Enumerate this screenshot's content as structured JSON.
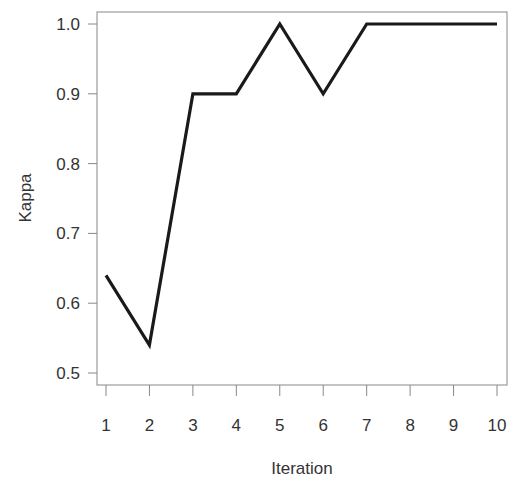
{
  "chart_data": {
    "type": "line",
    "title": "",
    "xlabel": "Iteration",
    "ylabel": "Kappa",
    "x": [
      1,
      2,
      3,
      4,
      5,
      6,
      7,
      8,
      9,
      10
    ],
    "series": [
      {
        "name": "Kappa",
        "values": [
          0.64,
          0.54,
          0.9,
          0.9,
          1.0,
          0.9,
          1.0,
          1.0,
          1.0,
          1.0
        ],
        "color": "#1a1a1a"
      }
    ],
    "xticks": [
      "1",
      "2",
      "3",
      "4",
      "5",
      "6",
      "7",
      "8",
      "9",
      "10"
    ],
    "yticks": [
      "0.5",
      "0.6",
      "0.7",
      "0.8",
      "0.9",
      "1.0"
    ],
    "xlim": [
      0.8,
      10.2
    ],
    "ylim": [
      0.48,
      1.02
    ],
    "grid": false,
    "legend": null
  }
}
